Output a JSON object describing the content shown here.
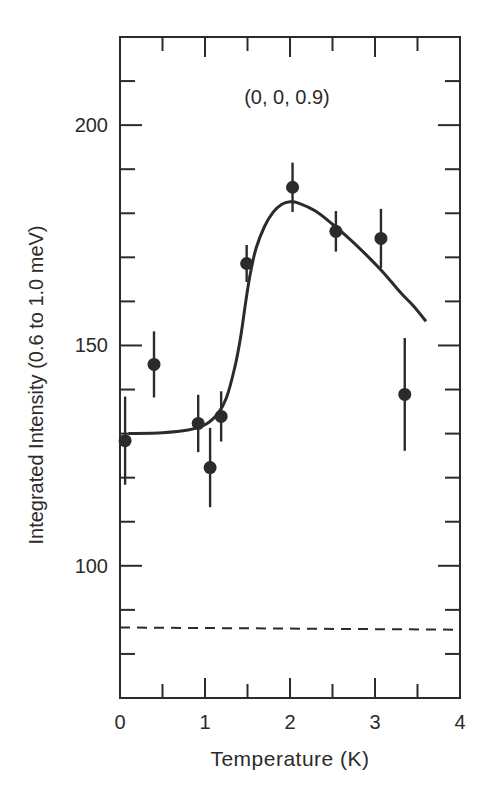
{
  "figure": {
    "annotation": "(0, 0, 0.9)",
    "colors": {
      "ink": "#2b2b2b",
      "background": "#ffffff"
    }
  },
  "chart_data": {
    "type": "scatter",
    "title": "",
    "annotation": "(0, 0, 0.9)",
    "xlabel": "Temperature (K)",
    "ylabel": "Integrated Intensity (0.6 to 1.0 meV)",
    "xlim": [
      0,
      4
    ],
    "ylim": [
      70,
      220
    ],
    "x_ticks": [
      0,
      1,
      2,
      3,
      4
    ],
    "x_tick_labels": [
      "0",
      "1",
      "2",
      "3",
      "4"
    ],
    "x_minor_step": 0.5,
    "y_ticks": [
      100,
      150,
      200
    ],
    "y_tick_labels": [
      "100",
      "150",
      "200"
    ],
    "y_minor_step": 10,
    "grid": false,
    "legend": null,
    "series": [
      {
        "name": "data",
        "kind": "points_with_errorbars",
        "x": [
          0.06,
          0.4,
          0.92,
          1.06,
          1.19,
          1.49,
          2.03,
          2.54,
          3.07,
          3.35
        ],
        "y": [
          128.4,
          145.7,
          132.3,
          122.3,
          133.9,
          168.6,
          185.9,
          175.9,
          174.3,
          138.9
        ],
        "y_err": [
          10.0,
          7.5,
          6.5,
          9.0,
          5.7,
          4.2,
          5.6,
          4.6,
          6.7,
          12.8
        ]
      },
      {
        "name": "fit",
        "kind": "solid_line",
        "x": [
          0.1,
          0.5,
          0.8,
          1.0,
          1.15,
          1.25,
          1.35,
          1.42,
          1.48,
          1.53,
          1.6,
          1.7,
          1.8,
          1.9,
          2.0,
          2.1,
          2.3,
          2.5,
          2.7,
          2.9,
          3.1,
          3.3,
          3.45,
          3.6
        ],
        "y": [
          130.0,
          130.2,
          130.8,
          132.0,
          134.5,
          138.0,
          145.0,
          152.0,
          160.0,
          166.0,
          172.0,
          177.0,
          180.2,
          182.0,
          182.6,
          182.3,
          180.5,
          177.5,
          174.2,
          170.5,
          166.5,
          162.0,
          159.0,
          155.5
        ]
      },
      {
        "name": "background",
        "kind": "dashed_line",
        "x": [
          0,
          4
        ],
        "y": [
          86.0,
          85.5
        ]
      }
    ]
  }
}
